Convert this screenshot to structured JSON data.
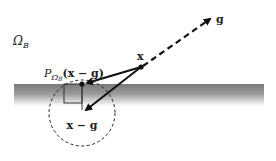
{
  "diagram": {
    "region_label": "Ω",
    "region_sub": "B",
    "point_x_label": "x",
    "point_g_label": "g",
    "projection_label_P": "P",
    "projection_label_sub_omega": "Ω",
    "projection_label_sub_B": "B",
    "projection_label_arg": "(x − g)",
    "difference_label": "x − g",
    "colors": {
      "ink": "#111111",
      "band_dark": "#7a7a7a",
      "band_light": "#ffffff"
    }
  }
}
